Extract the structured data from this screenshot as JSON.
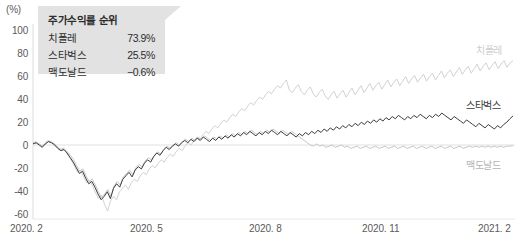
{
  "chart_data": {
    "type": "line",
    "title": "",
    "xlabel": "",
    "ylabel": "(%)",
    "ylim": [
      -60,
      100
    ],
    "xlim": [
      "2020.2",
      "2021.2"
    ],
    "grid": false,
    "zero_line": true,
    "legend_position": "right-inline",
    "y_ticks": [
      "100",
      "80",
      "60",
      "40",
      "20",
      "0",
      "-20",
      "-40",
      "-60"
    ],
    "y_tick_values": [
      100,
      80,
      60,
      40,
      20,
      0,
      -20,
      -40,
      -60
    ],
    "x_ticks": [
      "2020. 2",
      "2020. 5",
      "2020. 8",
      "2020. 11",
      "2021. 2"
    ],
    "series": [
      {
        "name": "치폴레",
        "color": "#d2d2d2",
        "final_value": 73.9,
        "values": [
          2,
          3,
          1,
          -1,
          2,
          4,
          3,
          1,
          -2,
          -4,
          -3,
          -6,
          -10,
          -14,
          -19,
          -24,
          -22,
          -28,
          -33,
          -31,
          -36,
          -42,
          -47,
          -44,
          -52,
          -58,
          -49,
          -45,
          -48,
          -41,
          -38,
          -35,
          -39,
          -33,
          -30,
          -32,
          -27,
          -24,
          -26,
          -21,
          -18,
          -20,
          -16,
          -13,
          -15,
          -11,
          -8,
          -10,
          -6,
          -3,
          -5,
          -1,
          2,
          0,
          4,
          7,
          5,
          9,
          12,
          10,
          14,
          17,
          15,
          19,
          22,
          20,
          24,
          27,
          25,
          29,
          32,
          30,
          34,
          37,
          35,
          39,
          42,
          40,
          44,
          47,
          45,
          49,
          52,
          50,
          54,
          57,
          48,
          46,
          50,
          53,
          47,
          44,
          48,
          51,
          45,
          42,
          46,
          49,
          43,
          40,
          44,
          47,
          41,
          45,
          48,
          42,
          46,
          50,
          44,
          48,
          52,
          46,
          50,
          54,
          48,
          52,
          55,
          49,
          53,
          57,
          51,
          55,
          58,
          52,
          56,
          60,
          54,
          58,
          61,
          55,
          59,
          62,
          56,
          60,
          63,
          57,
          61,
          65,
          59,
          63,
          66,
          60,
          64,
          68,
          62,
          66,
          69,
          63,
          67,
          71,
          65,
          69,
          72,
          66,
          70,
          73,
          67,
          71,
          74,
          68,
          72,
          73.9
        ]
      },
      {
        "name": "스타벅스",
        "color": "#3d3d3d",
        "final_value": 25.5,
        "values": [
          1,
          2,
          0,
          -2,
          1,
          3,
          2,
          0,
          -3,
          -5,
          -4,
          -7,
          -11,
          -15,
          -20,
          -25,
          -23,
          -29,
          -34,
          -32,
          -37,
          -43,
          -48,
          -45,
          -41,
          -47,
          -38,
          -34,
          -37,
          -30,
          -27,
          -24,
          -28,
          -22,
          -19,
          -21,
          -16,
          -13,
          -15,
          -10,
          -7,
          -9,
          -5,
          -2,
          -4,
          -1,
          1,
          -1,
          2,
          4,
          2,
          5,
          3,
          6,
          4,
          7,
          5,
          3,
          6,
          4,
          7,
          5,
          8,
          6,
          9,
          7,
          10,
          8,
          11,
          9,
          12,
          10,
          8,
          11,
          9,
          12,
          10,
          13,
          11,
          9,
          12,
          10,
          8,
          11,
          9,
          7,
          10,
          8,
          11,
          9,
          12,
          10,
          13,
          11,
          14,
          12,
          15,
          13,
          16,
          14,
          17,
          15,
          18,
          16,
          19,
          17,
          20,
          18,
          21,
          19,
          22,
          20,
          23,
          21,
          24,
          22,
          25,
          23,
          26,
          24,
          22,
          25,
          23,
          26,
          24,
          27,
          25,
          23,
          26,
          24,
          27,
          25,
          28,
          26,
          24,
          22,
          25,
          23,
          21,
          19,
          22,
          20,
          18,
          16,
          19,
          17,
          15,
          18,
          16,
          14,
          17,
          15,
          18,
          20,
          23,
          25.5
        ]
      },
      {
        "name": "맥도날드",
        "color": "#c6c6c6",
        "final_value": -0.6,
        "values": [
          1,
          2,
          1,
          -1,
          1,
          3,
          2,
          1,
          -2,
          -4,
          -3,
          -6,
          -9,
          -13,
          -18,
          -23,
          -21,
          -27,
          -32,
          -30,
          -35,
          -41,
          -46,
          -43,
          -39,
          -45,
          -36,
          -32,
          -35,
          -28,
          -25,
          -22,
          -26,
          -20,
          -17,
          -19,
          -14,
          -11,
          -13,
          -9,
          -6,
          -8,
          -4,
          -1,
          -3,
          0,
          2,
          0,
          3,
          5,
          3,
          6,
          4,
          7,
          5,
          8,
          6,
          4,
          7,
          5,
          8,
          6,
          9,
          7,
          10,
          8,
          11,
          9,
          12,
          10,
          13,
          11,
          9,
          12,
          10,
          13,
          11,
          14,
          12,
          10,
          13,
          11,
          9,
          12,
          10,
          8,
          6,
          4,
          2,
          0,
          -1,
          1,
          -1,
          0,
          -2,
          -1,
          0,
          -2,
          -1,
          0,
          -2,
          -1,
          -3,
          -2,
          -1,
          -3,
          -2,
          -1,
          -3,
          -2,
          -1,
          -3,
          -2,
          -1,
          -3,
          -2,
          -1,
          -3,
          -2,
          -1,
          -3,
          -2,
          -1,
          -3,
          -2,
          -1,
          -3,
          -2,
          -1,
          -3,
          -2,
          -1,
          -3,
          -2,
          -1,
          -3,
          -2,
          -1,
          -3,
          -2,
          -1,
          -2,
          -1,
          -2,
          -1,
          -2,
          -1,
          -2,
          -1,
          -2,
          -1,
          -2,
          -1,
          -1,
          -0.6
        ]
      }
    ]
  },
  "callout": {
    "title": "주가수익률 순위",
    "rows": [
      {
        "name": "치폴레",
        "value": "73.9%"
      },
      {
        "name": "스타벅스",
        "value": "25.5%"
      },
      {
        "name": "맥도날드",
        "value": "−0.6%"
      }
    ]
  },
  "series_labels": [
    {
      "text": "치폴레"
    },
    {
      "text": "스타벅스"
    },
    {
      "text": "맥도날드"
    }
  ]
}
